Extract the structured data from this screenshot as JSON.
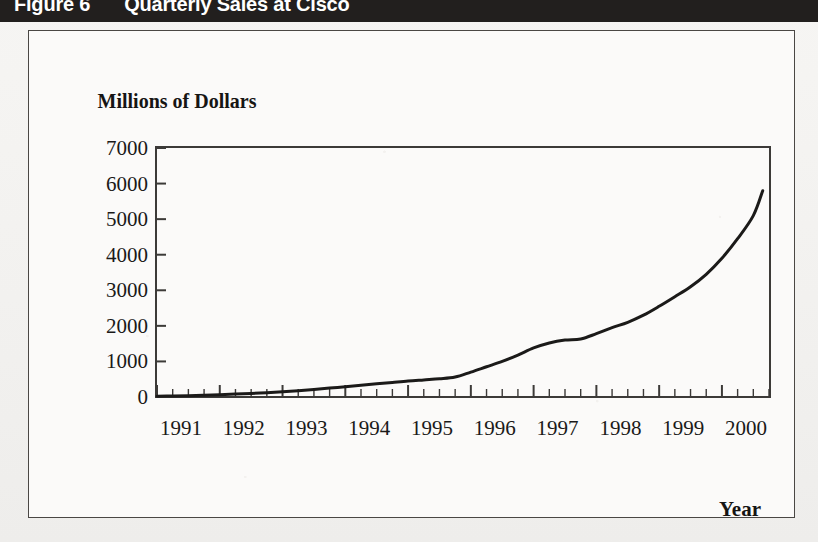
{
  "figure": {
    "number_label": "Figure 6",
    "title": "Quarterly Sales at Cisco",
    "banner_color": "#221f1e",
    "banner_text_color": "#ffffff",
    "frame_color": "#4a4744",
    "page_background": "#f4f3f1"
  },
  "chart_data": {
    "type": "line",
    "title": "Quarterly Sales at Cisco",
    "xlabel": "Year",
    "ylabel": "Millions of Dollars",
    "ylim": [
      0,
      7000
    ],
    "xlim": [
      1991,
      2000.75
    ],
    "ytick_labels": [
      "0",
      "1000",
      "2000",
      "3000",
      "4000",
      "5000",
      "6000",
      "7000"
    ],
    "ytick_values": [
      0,
      1000,
      2000,
      3000,
      4000,
      5000,
      6000,
      7000
    ],
    "xtick_labels": [
      "1991",
      "1992",
      "1993",
      "1994",
      "1995",
      "1996",
      "1997",
      "1998",
      "1999",
      "2000"
    ],
    "xtick_values": [
      1991,
      1992,
      1993,
      1994,
      1995,
      1996,
      1997,
      1998,
      1999,
      2000
    ],
    "minor_ticks": "quarterly",
    "grid": false,
    "legend": false,
    "line_color": "#1b1a19",
    "line_width": 3,
    "series": [
      {
        "name": "Quarterly Sales",
        "x": [
          1991.0,
          1991.25,
          1991.5,
          1991.75,
          1992.0,
          1992.25,
          1992.5,
          1992.75,
          1993.0,
          1993.25,
          1993.5,
          1993.75,
          1994.0,
          1994.25,
          1994.5,
          1994.75,
          1995.0,
          1995.25,
          1995.5,
          1995.75,
          1996.0,
          1996.25,
          1996.5,
          1996.75,
          1997.0,
          1997.25,
          1997.5,
          1997.75,
          1998.0,
          1998.25,
          1998.5,
          1998.75,
          1999.0,
          1999.25,
          1999.5,
          1999.75,
          2000.0,
          2000.25,
          2000.5,
          2000.65
        ],
        "values": [
          20,
          28,
          38,
          50,
          65,
          82,
          100,
          120,
          145,
          175,
          210,
          250,
          290,
          330,
          370,
          410,
          450,
          480,
          510,
          560,
          700,
          850,
          1000,
          1180,
          1380,
          1520,
          1600,
          1630,
          1780,
          1950,
          2100,
          2300,
          2550,
          2820,
          3100,
          3450,
          3900,
          4450,
          5100,
          5800
        ]
      }
    ]
  }
}
